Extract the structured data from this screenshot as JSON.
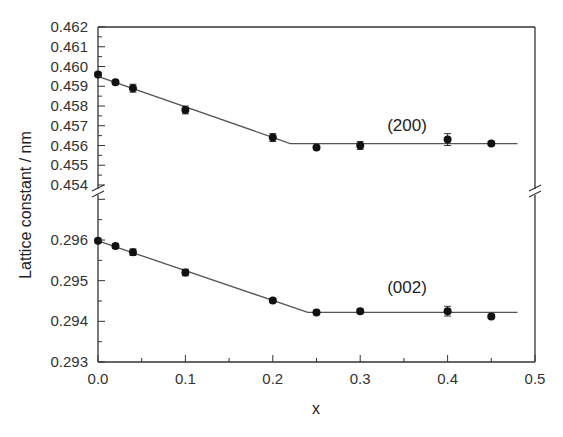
{
  "chart_data": {
    "type": "scatter",
    "title": "",
    "xlabel": "x",
    "ylabel": "Lattice constant / nm",
    "xlim": [
      0.0,
      0.5
    ],
    "x_ticks": [
      "0.0",
      "0.1",
      "0.2",
      "0.3",
      "0.4",
      "0.5"
    ],
    "broken_y_axis": true,
    "panels": [
      {
        "name": "upper",
        "ylim": [
          0.454,
          0.462
        ],
        "y_ticks": [
          "0.454",
          "0.455",
          "0.456",
          "0.457",
          "0.458",
          "0.459",
          "0.460",
          "0.461",
          "0.462"
        ],
        "series": [
          {
            "name": "(200)",
            "x": [
              0.0,
              0.02,
              0.04,
              0.1,
              0.2,
              0.25,
              0.3,
              0.4,
              0.45
            ],
            "y": [
              0.4596,
              0.4592,
              0.4589,
              0.4578,
              0.4564,
              0.4559,
              0.456,
              0.4563,
              0.4561
            ],
            "yerr": [
              0.0001,
              0.0001,
              0.0002,
              0.0002,
              0.0002,
              0.0001,
              0.0002,
              0.0003,
              0.0001
            ],
            "fit_line": [
              [
                0.0,
                0.4595
              ],
              [
                0.22,
                0.4561
              ],
              [
                0.48,
                0.4561
              ]
            ]
          }
        ]
      },
      {
        "name": "lower",
        "ylim": [
          0.293,
          0.2972
        ],
        "y_ticks": [
          "0.293",
          "0.294",
          "0.295",
          "0.296"
        ],
        "series": [
          {
            "name": "(002)",
            "x": [
              0.0,
              0.02,
              0.04,
              0.1,
              0.2,
              0.25,
              0.3,
              0.4,
              0.45
            ],
            "y": [
              0.29598,
              0.29585,
              0.2957,
              0.2952,
              0.29451,
              0.29422,
              0.29425,
              0.29425,
              0.29412
            ],
            "yerr": [
              5e-05,
              5e-05,
              8e-05,
              8e-05,
              5e-05,
              5e-05,
              5e-05,
              0.00012,
              5e-05
            ],
            "fit_line": [
              [
                0.0,
                0.29598
              ],
              [
                0.24,
                0.29422
              ],
              [
                0.48,
                0.29422
              ]
            ]
          }
        ]
      }
    ],
    "annotations": [
      {
        "text": "(200)",
        "x": 0.375,
        "y": 0.4568
      },
      {
        "text": "(002)",
        "x": 0.375,
        "y": 0.2948
      }
    ],
    "grid": false,
    "legend": "none"
  }
}
